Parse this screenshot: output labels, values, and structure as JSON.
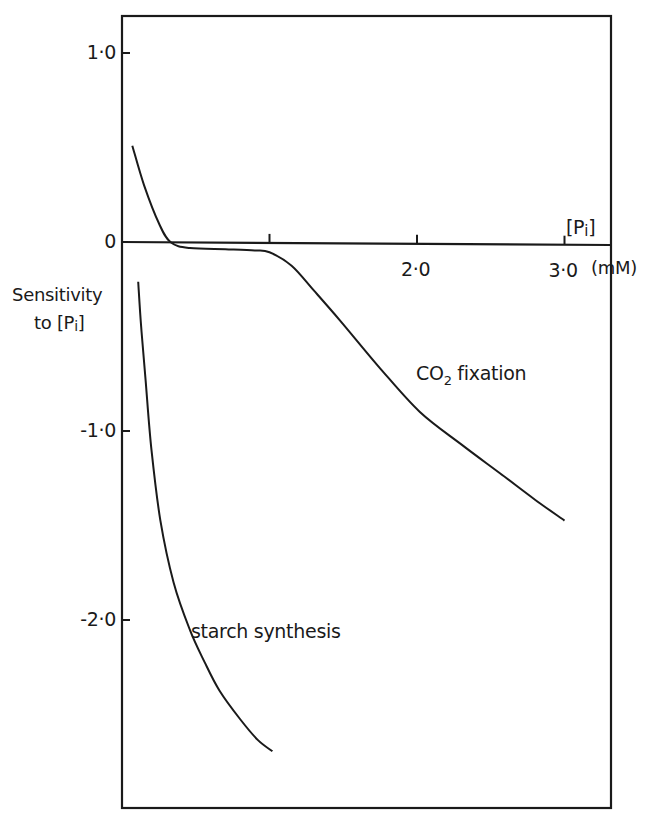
{
  "chart_data": {
    "type": "line",
    "title": "",
    "xlabel": "[Pi] (mM)",
    "ylabel": "Sensitivity to [Pi]",
    "xlim": [
      0,
      3.5
    ],
    "ylim": [
      -3.0,
      1.2
    ],
    "x_ticks": [
      1.0,
      2.0,
      3.0
    ],
    "x_tick_labels": [
      "",
      "2·0",
      "3·0"
    ],
    "y_ticks": [
      1.0,
      0,
      -1.0,
      -2.0
    ],
    "y_tick_labels": [
      "1·0",
      "0",
      "-1·0",
      "-2·0"
    ],
    "grid": false,
    "legend": "inline labels",
    "series": [
      {
        "name": "CO2 fixation",
        "x": [
          0.07,
          0.15,
          0.25,
          0.33,
          0.46,
          0.7,
          0.9,
          1.0,
          1.15,
          1.3,
          1.48,
          1.75,
          2.02,
          2.3,
          2.56,
          2.8,
          3.0
        ],
        "values": [
          0.51,
          0.3,
          0.1,
          0.0,
          -0.03,
          -0.035,
          -0.04,
          -0.05,
          -0.12,
          -0.25,
          -0.41,
          -0.66,
          -0.89,
          -1.06,
          -1.21,
          -1.35,
          -1.46
        ]
      },
      {
        "name": "starch synthesis",
        "x": [
          0.11,
          0.13,
          0.16,
          0.2,
          0.26,
          0.35,
          0.46,
          0.56,
          0.66,
          0.8,
          0.92,
          1.02
        ],
        "values": [
          -0.21,
          -0.45,
          -0.73,
          -1.1,
          -1.47,
          -1.8,
          -2.05,
          -2.22,
          -2.37,
          -2.52,
          -2.63,
          -2.69
        ]
      }
    ]
  },
  "labels": {
    "y_axis_line1": "Sensitivity",
    "y_axis_line2_prefix": "to [P",
    "y_axis_line2_sub": "i",
    "y_axis_line2_suffix": "]",
    "x_axis_name_prefix": "[P",
    "x_axis_name_sub": "i",
    "x_axis_name_suffix": "]",
    "x_axis_unit": "(mM)",
    "co2_prefix": "CO",
    "co2_sub": "2",
    "co2_suffix": " fixation",
    "starch": "starch synthesis"
  },
  "colors": {
    "ink": "#1a1a1a",
    "background": "#ffffff"
  }
}
